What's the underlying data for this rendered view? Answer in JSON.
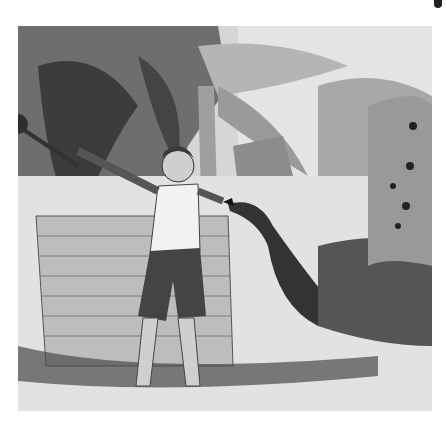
{
  "image": {
    "style": "black-and-white pencil/charcoal illustration",
    "scene": "A barefoot boy in a white shirt and dark shorts stands beside a brick well, raising a club over his shoulder with one hand and reaching toward a peacock with the other. The peacock stretches its neck toward the boy's hand; its long fanned tail rises on the right. Banana/palm trees and a thatched hut are in the background, with grass and shadows on the ground.",
    "colors": {
      "background": "#ffffff",
      "paper": "#d9d9d9",
      "ink": "#2a2a2a",
      "mid": "#8a8a8a",
      "light": "#eeeeee"
    }
  }
}
